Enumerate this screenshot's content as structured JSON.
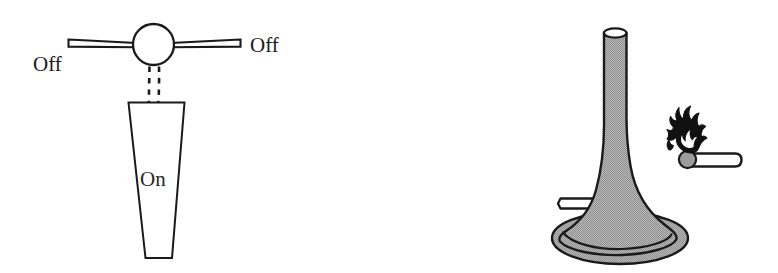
{
  "figure": {
    "panels": [
      {
        "id": "valve-panel",
        "name": "gas-tap-diagram",
        "labels": {
          "off_left": "Off",
          "off_right": "Off",
          "on": "On"
        }
      },
      {
        "id": "burner-panel",
        "name": "bunsen-burner-diagram",
        "labels": {}
      }
    ]
  },
  "colors": {
    "outline": "#1a1a1a",
    "metal_gray": "#a9a9a9",
    "match_head_gray": "#9a9a9a",
    "flame_black": "#111111",
    "paper_white": "#ffffff"
  },
  "valve": {
    "handle_label_left": "Off",
    "handle_label_right": "Off",
    "flame_label": "On",
    "icon_names": [
      "valve-knob-icon",
      "valve-arm-left-icon",
      "valve-arm-right-icon",
      "gas-stream-dashed-icon",
      "flame-cone-icon"
    ]
  },
  "burner": {
    "icon_names": [
      "burner-barrel-icon",
      "burner-base-icon",
      "burner-gas-inlet-icon",
      "match-stick-icon",
      "match-flame-icon"
    ]
  }
}
